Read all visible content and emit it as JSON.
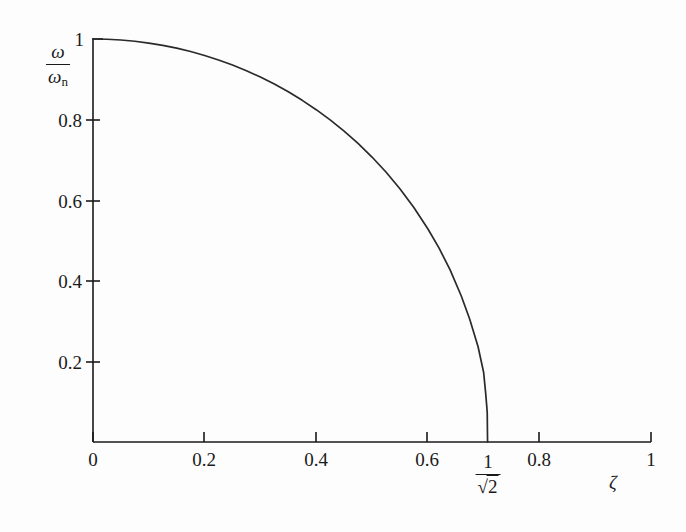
{
  "figure": {
    "background_color": "#fdfdfd",
    "line_color": "#2a2a2a",
    "axis_color": "#1a1a1a"
  },
  "axes": {
    "y_title_numerator": "ω",
    "y_title_denominator_symbol": "ω",
    "y_title_denominator_subscript": "n",
    "x_title": "ζ"
  },
  "x_ticks": [
    {
      "label": "0",
      "value": 0
    },
    {
      "label": "0.2",
      "value": 0.2
    },
    {
      "label": "0.4",
      "value": 0.4
    },
    {
      "label": "0.6",
      "value": 0.6
    },
    {
      "label": "0.8",
      "value": 0.8
    },
    {
      "label": "1",
      "value": 1
    }
  ],
  "y_ticks": [
    {
      "label": "0.2",
      "value": 0.2
    },
    {
      "label": "0.4",
      "value": 0.4
    },
    {
      "label": "0.6",
      "value": 0.6
    },
    {
      "label": "0.8",
      "value": 0.8
    },
    {
      "label": "1",
      "value": 1
    }
  ],
  "special_x_label": {
    "numerator": "1",
    "denominator_radical": "√",
    "denominator_radicand": "2",
    "value": 0.7071067811865476
  },
  "chart_data": {
    "type": "line",
    "title": "",
    "subtitle": "",
    "xlabel": "ζ",
    "ylabel": "ω/ωn",
    "xlim": [
      0,
      1
    ],
    "ylim": [
      0,
      1
    ],
    "grid": false,
    "legend": null,
    "xticks": [
      0,
      0.2,
      0.4,
      0.6,
      0.8,
      1
    ],
    "xticklabels": [
      "0",
      "0.2",
      "0.4",
      "0.6",
      "0.8",
      "1"
    ],
    "yticks": [
      0.2,
      0.4,
      0.6,
      0.8,
      1
    ],
    "yticklabels": [
      "0.2",
      "0.4",
      "0.6",
      "0.8",
      "1"
    ],
    "annotations": [
      {
        "text": "1/√2",
        "x": 0.7071,
        "y": 0,
        "position": "below-axis"
      }
    ],
    "series": [
      {
        "name": "ω/ωn = sqrt(1 - 2ζ^2)",
        "x": [
          0,
          0.025,
          0.05,
          0.075,
          0.1,
          0.125,
          0.15,
          0.175,
          0.2,
          0.225,
          0.25,
          0.275,
          0.3,
          0.325,
          0.35,
          0.375,
          0.4,
          0.425,
          0.45,
          0.475,
          0.5,
          0.525,
          0.55,
          0.575,
          0.6,
          0.62,
          0.64,
          0.66,
          0.675,
          0.69,
          0.7,
          0.7035,
          0.7055,
          0.7065,
          0.7071
        ],
        "y": [
          1,
          0.99937,
          0.99749,
          0.99436,
          0.98995,
          0.98425,
          0.97724,
          0.96889,
          0.95917,
          0.94802,
          0.93541,
          0.92128,
          0.90554,
          0.88812,
          0.86891,
          0.84779,
          0.82462,
          0.79922,
          0.77136,
          0.74079,
          0.70711,
          0.66989,
          0.6285,
          0.58205,
          0.52915,
          0.48166,
          0.42708,
          0.36222,
          0.30516,
          0.23685,
          0.17321,
          0.12429,
          0.09138,
          0.07246,
          0.0
        ]
      }
    ]
  }
}
